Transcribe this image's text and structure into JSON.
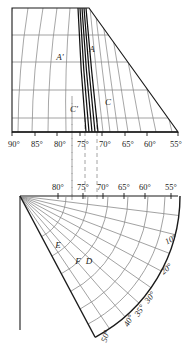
{
  "figure": {
    "panels": [
      "upper-trapezoid-grid",
      "lower-polar-fan"
    ]
  },
  "colors": {
    "ink": "#1a1a1a",
    "grid": "#8a8a8a",
    "curve": "#7b7b7b",
    "heavy": "#111111",
    "dash": "#9a9a9a",
    "text": "#222222"
  },
  "upper": {
    "axis_labels": [
      "90°",
      "85°",
      "80°",
      "75°",
      "70°",
      "65°",
      "60°",
      "55°"
    ],
    "axis_x": [
      14,
      37,
      60,
      83,
      105,
      128,
      150,
      176
    ],
    "tick_x": [
      12,
      35,
      57,
      80,
      102,
      125,
      147,
      178
    ],
    "point_labels": [
      {
        "text": "A'",
        "x": 60,
        "y": 60
      },
      {
        "text": "A",
        "x": 92,
        "y": 52
      },
      {
        "text": "C'",
        "x": 74,
        "y": 112
      },
      {
        "text": "C",
        "x": 108,
        "y": 105
      }
    ],
    "hgrid_y": [
      35,
      62,
      90,
      118
    ],
    "curve_count": 14,
    "heavy_curve_count": 5
  },
  "lower": {
    "top_labels": [
      "80°",
      "75°",
      "70°",
      "65°",
      "60°",
      "55°"
    ],
    "top_label_x": [
      58,
      83,
      103,
      124,
      145,
      171
    ],
    "radial_labels": [
      "10°",
      "20°",
      "30°",
      "35°",
      "40°",
      "50°"
    ],
    "radial_label_pos": [
      {
        "text": "10°",
        "x": 172,
        "y": 242
      },
      {
        "text": "20°",
        "x": 168,
        "y": 271
      },
      {
        "text": "30°",
        "x": 152,
        "y": 299
      },
      {
        "text": "35°",
        "x": 142,
        "y": 312
      },
      {
        "text": "40°",
        "x": 131,
        "y": 322
      },
      {
        "text": "50°",
        "x": 108,
        "y": 337
      }
    ],
    "point_labels": [
      {
        "text": "E",
        "x": 58,
        "y": 248
      },
      {
        "text": "F",
        "x": 78,
        "y": 264
      },
      {
        "text": "D",
        "x": 89,
        "y": 264
      }
    ],
    "apex": {
      "x": 20,
      "y": 196
    },
    "arc_count": 7,
    "ray_count": 8
  },
  "dashed_lines": {
    "x_positions": [
      72,
      85,
      97
    ],
    "label_refs": [
      "75°",
      "70°"
    ]
  }
}
